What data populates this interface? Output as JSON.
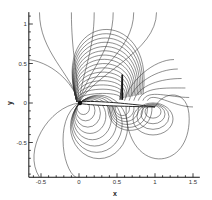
{
  "chart_data": {
    "type": "contour",
    "title": "",
    "xlabel": "x",
    "ylabel": "y",
    "xlim": [
      -0.66,
      1.59
    ],
    "ylim": [
      -0.94,
      1.15
    ],
    "grid": false,
    "legend": null,
    "x_ticks": [
      -0.5,
      0,
      0.5,
      1,
      1.5
    ],
    "x_tick_labels": [
      "-0.5",
      "0",
      "0.5",
      "1",
      "1.5"
    ],
    "y_ticks": [
      -0.5,
      0,
      0.5,
      1
    ],
    "y_tick_labels": [
      "-0.5",
      "0",
      "0.5",
      "1"
    ],
    "airfoil": {
      "leading_edge": [
        0,
        0
      ],
      "trailing_edge": [
        1,
        -0.05
      ],
      "max_thickness": 0.06
    },
    "shock": {
      "x": 0.57,
      "y_bottom": 0.04,
      "y_top": 0.36
    },
    "annotations": []
  },
  "layout": {
    "px_origin_x": 79,
    "px_origin_y": 103,
    "px_per_unit_x": 76,
    "px_per_unit_y": 79
  }
}
